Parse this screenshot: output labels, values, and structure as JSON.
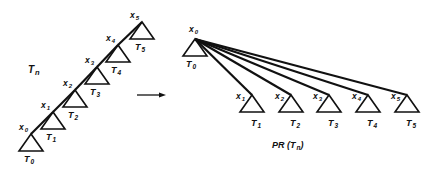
{
  "diagram": {
    "left": {
      "title": "T",
      "title_sub": "n",
      "nodes": [
        {
          "label": "x",
          "sub": "0",
          "tree": "T",
          "tree_sub": "0",
          "ax": 31,
          "ay": 134
        },
        {
          "label": "x",
          "sub": "1",
          "tree": "T",
          "tree_sub": "1",
          "ax": 53,
          "ay": 112
        },
        {
          "label": "x",
          "sub": "2",
          "tree": "T",
          "tree_sub": "2",
          "ax": 75,
          "ay": 90
        },
        {
          "label": "x",
          "sub": "3",
          "tree": "T",
          "tree_sub": "3",
          "ax": 97,
          "ay": 67
        },
        {
          "label": "x",
          "sub": "4",
          "tree": "T",
          "tree_sub": "4",
          "ax": 118,
          "ay": 45
        },
        {
          "label": "x",
          "sub": "5",
          "tree": "T",
          "tree_sub": "5",
          "ax": 142,
          "ay": 22
        }
      ]
    },
    "arrow": {
      "x1": 137,
      "y1": 95,
      "x2": 166,
      "y2": 95
    },
    "right": {
      "title": "PR (T",
      "title_sub": "n",
      "title_end": ")",
      "root": {
        "label": "x",
        "sub": "0",
        "tree": "T",
        "tree_sub": "0",
        "ax": 195,
        "ay": 39
      },
      "children": [
        {
          "label": "x",
          "sub": "1",
          "tree": "T",
          "tree_sub": "1",
          "ax": 252,
          "ay": 95
        },
        {
          "label": "x",
          "sub": "2",
          "tree": "T",
          "tree_sub": "2",
          "ax": 291,
          "ay": 95
        },
        {
          "label": "x",
          "sub": "3",
          "tree": "T",
          "tree_sub": "3",
          "ax": 329,
          "ay": 95
        },
        {
          "label": "x",
          "sub": "4",
          "tree": "T",
          "tree_sub": "4",
          "ax": 368,
          "ay": 95
        },
        {
          "label": "x",
          "sub": "5",
          "tree": "T",
          "tree_sub": "5",
          "ax": 407,
          "ay": 95
        }
      ]
    }
  }
}
